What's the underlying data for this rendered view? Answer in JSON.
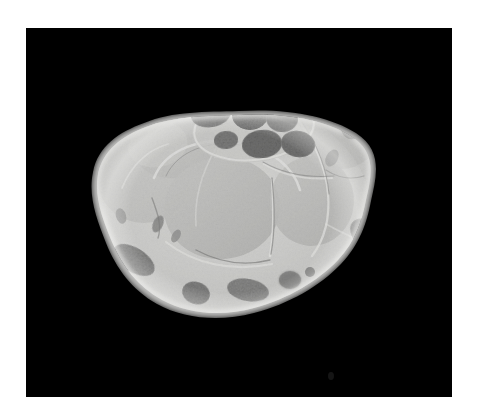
{
  "viewer": {
    "background_color": "#ffffff",
    "frame_color": "#000000",
    "frame": {
      "x": 26,
      "y": 28,
      "width": 426,
      "height": 369
    },
    "caption": "",
    "title": ""
  },
  "specimen": {
    "name": "wrist-cross-section",
    "description": "Grayscale anatomical cross-section of a wrist (carpal tunnel level) on black background",
    "modality": "anatomical cross-section photograph",
    "orientation": "axial",
    "outline_center": {
      "cx": 213,
      "cy": 185
    },
    "outline_rx": 123,
    "outline_ry": 98,
    "rotation_deg": -12,
    "tone_values": {
      "background": "#000000",
      "cortex_rim": "#e8e8e6",
      "soft_tissue_light": "#d9d9d7",
      "soft_tissue_mid": "#c2c2c0",
      "muscle_body": "#b4b4b2",
      "septa_bright": "#f2f2f0",
      "vessel_dark": "#5a5a5a",
      "nerve_fascicle_dark": "#3d3d3d",
      "deep_shadow": "#2a2a2a"
    }
  },
  "regions": [
    {
      "id": "r1",
      "label": "nerve-bundle-superior",
      "cx": 245,
      "cy": 72,
      "rx": 34,
      "ry": 17,
      "rot": -16,
      "tone": "#7b7b7b",
      "texture": "stipple"
    },
    {
      "id": "r2",
      "label": "nerve-bundle-central-left",
      "cx": 185,
      "cy": 86,
      "rx": 20,
      "ry": 13,
      "rot": -10,
      "tone": "#6e6e6e",
      "texture": "stipple"
    },
    {
      "id": "r3",
      "label": "nerve-bundle-central",
      "cx": 224,
      "cy": 87,
      "rx": 18,
      "ry": 15,
      "rot": 0,
      "tone": "#5f5f5f",
      "texture": "stipple"
    },
    {
      "id": "r4",
      "label": "nerve-bundle-central-right",
      "cx": 256,
      "cy": 90,
      "rx": 16,
      "ry": 14,
      "rot": 6,
      "tone": "#696969",
      "texture": "stipple"
    },
    {
      "id": "r5",
      "label": "nerve-bundle-inferior",
      "cx": 236,
      "cy": 116,
      "rx": 20,
      "ry": 14,
      "rot": -6,
      "tone": "#5b5b5b",
      "texture": "stipple"
    },
    {
      "id": "r6",
      "label": "nerve-bundle-inferior-right",
      "cx": 272,
      "cy": 116,
      "rx": 17,
      "ry": 13,
      "rot": 10,
      "tone": "#646464",
      "texture": "stipple"
    },
    {
      "id": "r7",
      "label": "vessel-upper-left",
      "cx": 108,
      "cy": 82,
      "rx": 20,
      "ry": 10,
      "rot": -22,
      "tone": "#8a8a8a",
      "texture": "smooth"
    },
    {
      "id": "r8",
      "label": "vessel-upper-right",
      "cx": 330,
      "cy": 88,
      "rx": 16,
      "ry": 24,
      "rot": 18,
      "tone": "#6f6f6f",
      "texture": "smooth"
    },
    {
      "id": "r9",
      "label": "tendon-lower-left",
      "cx": 108,
      "cy": 232,
      "rx": 22,
      "ry": 12,
      "rot": 32,
      "tone": "#8f8f8f",
      "texture": "stipple"
    },
    {
      "id": "r10",
      "label": "tendon-lower-mid",
      "cx": 170,
      "cy": 265,
      "rx": 14,
      "ry": 11,
      "rot": 18,
      "tone": "#7d7d7d",
      "texture": "stipple"
    },
    {
      "id": "r11",
      "label": "tendon-lower-mid-right",
      "cx": 222,
      "cy": 262,
      "rx": 20,
      "ry": 11,
      "rot": 10,
      "tone": "#8b8b8b",
      "texture": "stipple"
    },
    {
      "id": "r12",
      "label": "tendon-lower-right",
      "cx": 264,
      "cy": 252,
      "rx": 11,
      "ry": 9,
      "rot": 0,
      "tone": "#7a7a7a",
      "texture": "stipple"
    },
    {
      "id": "r13",
      "label": "vessel-right-lateral",
      "cx": 346,
      "cy": 210,
      "rx": 24,
      "ry": 15,
      "rot": 38,
      "tone": "#8d8d8d",
      "texture": "stipple"
    },
    {
      "id": "r14",
      "label": "vessel-left-lateral",
      "cx": 62,
      "cy": 182,
      "rx": 9,
      "ry": 15,
      "rot": 14,
      "tone": "#9a9a9a",
      "texture": "smooth"
    },
    {
      "id": "r15",
      "label": "muscle-body-central",
      "cx": 195,
      "cy": 178,
      "rx": 57,
      "ry": 50,
      "rot": -6,
      "tone": "#b6b6b4",
      "texture": "fine"
    },
    {
      "id": "r16",
      "label": "muscle-body-left",
      "cx": 118,
      "cy": 152,
      "rx": 45,
      "ry": 42,
      "rot": 0,
      "tone": "#c4c4c2",
      "texture": "fine"
    },
    {
      "id": "r17",
      "label": "muscle-body-right",
      "cx": 285,
      "cy": 172,
      "rx": 41,
      "ry": 44,
      "rot": 4,
      "tone": "#bcbcba",
      "texture": "fine"
    },
    {
      "id": "r18",
      "label": "muscle-body-upper-right",
      "cx": 315,
      "cy": 108,
      "rx": 36,
      "ry": 32,
      "rot": 0,
      "tone": "#c8c8c6",
      "texture": "fine"
    },
    {
      "id": "r19",
      "label": "muscle-body-upper-left",
      "cx": 150,
      "cy": 120,
      "rx": 40,
      "ry": 28,
      "rot": -8,
      "tone": "#cccccA",
      "texture": "fine"
    }
  ],
  "septa": [
    {
      "id": "s1",
      "label": "septum-central-arc"
    },
    {
      "id": "s2",
      "label": "septum-oblique-right"
    },
    {
      "id": "s3",
      "label": "septum-vertical-mid"
    },
    {
      "id": "s4",
      "label": "septum-lower-arc"
    },
    {
      "id": "s5",
      "label": "septum-left-arc"
    }
  ]
}
